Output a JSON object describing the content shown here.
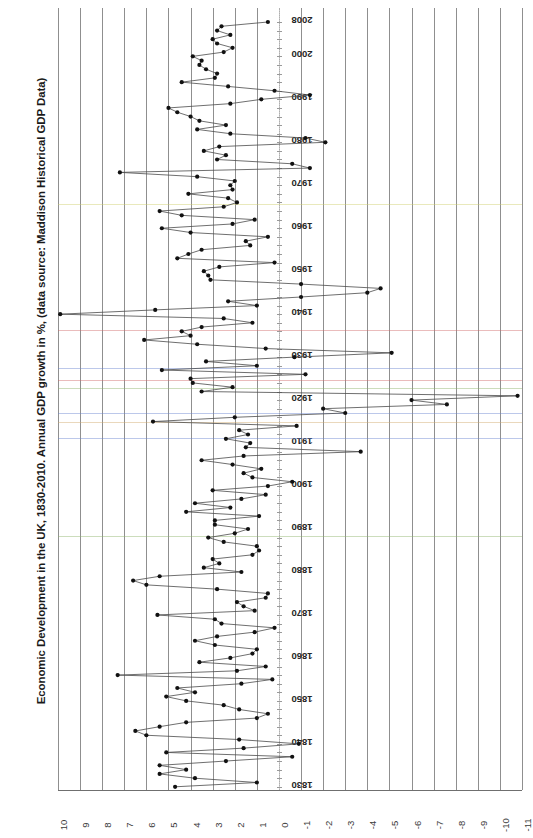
{
  "chart": {
    "title": "Economic Development in the UK, 1830-2010. Annual GDP growth in %, (data source: Maddison Historical GDP Data)",
    "orientation": "rotated-90",
    "value_axis_label": "",
    "year_axis_label": ""
  },
  "axis": {
    "value_ticks": [
      "10",
      "9",
      "8",
      "7",
      "6",
      "5",
      "4",
      "3",
      "2",
      "1",
      "0",
      "-1",
      "-2",
      "-3",
      "-4",
      "-5",
      "-6",
      "-7",
      "-8",
      "-9",
      "-10",
      "-11"
    ],
    "year_ticks": [
      "2008",
      "2000",
      "1990",
      "1980",
      "1970",
      "1960",
      "1950",
      "1940",
      "1930",
      "1920",
      "1910",
      "1900",
      "1890",
      "1880",
      "1870",
      "1860",
      "1850",
      "1840",
      "1830"
    ]
  },
  "colors": {
    "grid": "#8f8f8f",
    "line": "#4a4a4a",
    "marker": "#111111",
    "text": "#1a1a1a"
  },
  "chart_data": {
    "type": "line",
    "title": "Economic Development in the UK, 1830-2010. Annual GDP growth in %, (data source: Maddison Historical GDP Data)",
    "xlabel": "Year",
    "ylabel": "Annual GDP growth in %",
    "xlim": [
      1830,
      2010
    ],
    "ylim": [
      -11,
      10
    ],
    "grid": true,
    "legend": "none",
    "markers": true,
    "x": [
      1830,
      1831,
      1832,
      1833,
      1834,
      1835,
      1836,
      1837,
      1838,
      1839,
      1840,
      1841,
      1842,
      1843,
      1844,
      1845,
      1846,
      1847,
      1848,
      1849,
      1850,
      1851,
      1852,
      1853,
      1854,
      1855,
      1856,
      1857,
      1858,
      1859,
      1860,
      1861,
      1862,
      1863,
      1864,
      1865,
      1866,
      1867,
      1868,
      1869,
      1870,
      1871,
      1872,
      1873,
      1874,
      1875,
      1876,
      1877,
      1878,
      1879,
      1880,
      1881,
      1882,
      1883,
      1884,
      1885,
      1886,
      1887,
      1888,
      1889,
      1890,
      1891,
      1892,
      1893,
      1894,
      1895,
      1896,
      1897,
      1898,
      1899,
      1900,
      1901,
      1902,
      1903,
      1904,
      1905,
      1906,
      1907,
      1908,
      1909,
      1910,
      1911,
      1912,
      1913,
      1914,
      1915,
      1916,
      1917,
      1918,
      1919,
      1920,
      1921,
      1922,
      1923,
      1924,
      1925,
      1926,
      1927,
      1928,
      1929,
      1930,
      1931,
      1932,
      1933,
      1934,
      1935,
      1936,
      1937,
      1938,
      1939,
      1940,
      1941,
      1942,
      1943,
      1944,
      1945,
      1946,
      1947,
      1948,
      1949,
      1950,
      1951,
      1952,
      1953,
      1954,
      1955,
      1956,
      1957,
      1958,
      1959,
      1960,
      1961,
      1962,
      1963,
      1964,
      1965,
      1966,
      1967,
      1968,
      1969,
      1970,
      1971,
      1972,
      1973,
      1974,
      1975,
      1976,
      1977,
      1978,
      1979,
      1980,
      1981,
      1982,
      1983,
      1984,
      1985,
      1986,
      1987,
      1988,
      1989,
      1990,
      1991,
      1992,
      1993,
      1994,
      1995,
      1996,
      1997,
      1998,
      1999,
      2000,
      2001,
      2002,
      2003,
      2004,
      2005,
      2006,
      2007,
      2008
    ],
    "values": [
      4.7,
      1.0,
      3.8,
      5.4,
      4.2,
      5.4,
      2.4,
      -0.6,
      5.1,
      1.6,
      -0.9,
      1.8,
      6.0,
      6.5,
      5.4,
      4.2,
      1.0,
      0.5,
      1.8,
      2.5,
      4.2,
      5.1,
      3.8,
      4.6,
      1.7,
      0.3,
      7.3,
      1.9,
      0.6,
      3.6,
      2.2,
      1.2,
      1.0,
      2.9,
      3.8,
      2.8,
      1.1,
      0.2,
      2.6,
      2.9,
      5.5,
      1.1,
      1.6,
      1.9,
      0.6,
      0.5,
      2.8,
      6.0,
      6.6,
      5.4,
      1.7,
      3.4,
      2.7,
      3.0,
      1.2,
      0.9,
      1.0,
      2.5,
      3.2,
      2.0,
      1.4,
      2.9,
      2.9,
      0.9,
      4.2,
      2.2,
      3.8,
      1.7,
      0.6,
      3.0,
      0.5,
      -0.6,
      1.2,
      1.6,
      0.8,
      2.1,
      3.5,
      1.6,
      -3.7,
      1.5,
      1.3,
      2.4,
      1.4,
      1.8,
      -0.8,
      5.7,
      2.0,
      -3.0,
      -2.0,
      -7.6,
      -6.0,
      -10.8,
      3.5,
      2.1,
      3.9,
      4.0,
      -1.2,
      5.3,
      1.0,
      3.3,
      -0.7,
      -5.1,
      0.6,
      3.7,
      6.1,
      4.0,
      4.4,
      3.5,
      1.2,
      2.5,
      9.9,
      5.6,
      1.0,
      2.3,
      -1.0,
      -4.0,
      -4.6,
      -1.0,
      3.1,
      3.2,
      3.4,
      2.7,
      0.2,
      4.6,
      4.1,
      3.5,
      1.3,
      1.5,
      0.5,
      4.0,
      5.3,
      2.1,
      1.1,
      4.4,
      5.4,
      2.5,
      1.9,
      2.3,
      4.1,
      2.1,
      2.2,
      2.0,
      3.7,
      7.2,
      -1.4,
      -0.6,
      2.8,
      2.4,
      3.4,
      2.7,
      -2.1,
      -1.2,
      2.2,
      3.7,
      2.4,
      3.6,
      4.0,
      4.6,
      5.0,
      2.2,
      0.8,
      -1.4,
      0.2,
      2.3,
      4.4,
      2.9,
      2.8,
      3.3,
      3.6,
      3.5,
      3.9,
      2.5,
      2.1,
      2.8,
      3.0,
      2.2,
      2.8,
      2.6,
      0.5
    ]
  }
}
